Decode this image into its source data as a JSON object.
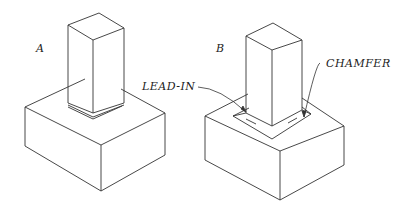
{
  "figure": {
    "part_a": {
      "label": "A"
    },
    "part_b": {
      "label": "B"
    },
    "callouts": {
      "lead_in": "LEAD-IN",
      "chamfer": "CHAMFER"
    }
  },
  "colors": {
    "line": "#333333",
    "background": "#ffffff"
  }
}
